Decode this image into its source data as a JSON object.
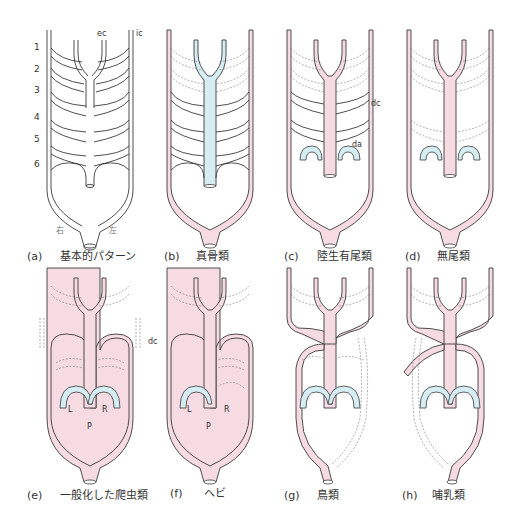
{
  "colors": {
    "outline": "#3a3a3a",
    "systemic_pink": "#f6dbe3",
    "pulmonary_blue": "#d6eef3",
    "dashed": "#777777",
    "text": "#333333"
  },
  "arch_numbers": [
    "1",
    "2",
    "3",
    "4",
    "5",
    "6"
  ],
  "panel_a_labels": {
    "ec": "ec",
    "ic": "ic",
    "right": "右",
    "left": "左"
  },
  "panel_c_labels": {
    "dc": "dc",
    "da": "da"
  },
  "panel_e_labels": {
    "L": "L",
    "R": "R",
    "P": "P"
  },
  "panel_f_labels": {
    "dc": "dc",
    "L": "L",
    "R": "R",
    "P": "P"
  },
  "panels": [
    {
      "id": "a",
      "letter": "(a)",
      "caption": "基本的パターン"
    },
    {
      "id": "b",
      "letter": "(b)",
      "caption": "真骨類"
    },
    {
      "id": "c",
      "letter": "(c)",
      "caption": "陸生有尾類"
    },
    {
      "id": "d",
      "letter": "(d)",
      "caption": "無尾類"
    },
    {
      "id": "e",
      "letter": "(e)",
      "caption": "一般化した爬虫類"
    },
    {
      "id": "f",
      "letter": "(f)",
      "caption": "ヘビ"
    },
    {
      "id": "g",
      "letter": "(g)",
      "caption": "鳥類"
    },
    {
      "id": "h",
      "letter": "(h)",
      "caption": "哺乳類"
    }
  ]
}
